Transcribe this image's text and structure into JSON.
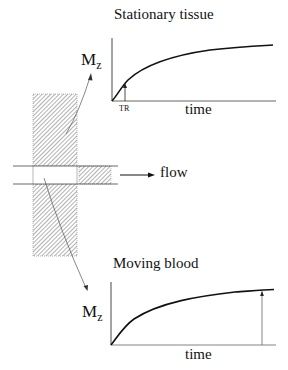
{
  "top_panel": {
    "title": "Stationary tissue",
    "y_label": "M",
    "y_label_sub": "z",
    "x_label": "time",
    "marker_label": "TR"
  },
  "bottom_panel": {
    "title": "Moving blood",
    "y_label": "M",
    "y_label_sub": "z",
    "x_label": "time"
  },
  "slab": {
    "flow_label": "flow"
  },
  "colors": {
    "line": "#111111",
    "hatch": "#555555",
    "thin": "#777777"
  }
}
